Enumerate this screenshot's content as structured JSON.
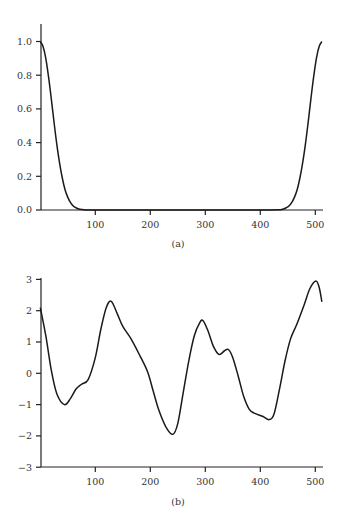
{
  "chart_data": [
    {
      "type": "line",
      "panel_label": "(a)",
      "title": "",
      "xlabel": "",
      "ylabel": "",
      "xlim": [
        0,
        512
      ],
      "ylim": [
        0.0,
        1.05
      ],
      "x_ticks": [
        "100",
        "200",
        "300",
        "400",
        "500"
      ],
      "y_ticks": [
        "0.0",
        "0.2",
        "0.4",
        "0.6",
        "0.8",
        "1.0"
      ],
      "grid": false,
      "legend": null,
      "series": [
        {
          "name": "window",
          "x": [
            0,
            5,
            10,
            15,
            20,
            25,
            30,
            35,
            40,
            45,
            50,
            55,
            60,
            65,
            70,
            80,
            100,
            200,
            300,
            400,
            432,
            442,
            447,
            452,
            457,
            462,
            467,
            472,
            477,
            482,
            487,
            492,
            497,
            502,
            507,
            512
          ],
          "values": [
            1.0,
            0.97,
            0.9,
            0.79,
            0.66,
            0.52,
            0.39,
            0.28,
            0.19,
            0.12,
            0.075,
            0.044,
            0.024,
            0.013,
            0.006,
            0.001,
            0.0,
            0.0,
            0.0,
            0.0,
            0.001,
            0.006,
            0.013,
            0.024,
            0.044,
            0.075,
            0.12,
            0.19,
            0.28,
            0.39,
            0.52,
            0.66,
            0.79,
            0.9,
            0.97,
            1.0
          ]
        }
      ]
    },
    {
      "type": "line",
      "panel_label": "(b)",
      "title": "",
      "xlabel": "",
      "ylabel": "",
      "xlim": [
        0,
        512
      ],
      "ylim": [
        -3,
        3
      ],
      "x_ticks": [
        "100",
        "200",
        "300",
        "400",
        "500"
      ],
      "y_ticks": [
        "-3",
        "-2",
        "-1",
        "0",
        "1",
        "2",
        "3"
      ],
      "grid": false,
      "legend": null,
      "series": [
        {
          "name": "signal",
          "x": [
            0,
            10,
            20,
            30,
            44,
            55,
            65,
            75,
            87,
            100,
            110,
            120,
            129,
            140,
            150,
            165,
            180,
            195,
            205,
            215,
            228,
            241,
            250,
            260,
            270,
            280,
            290,
            296,
            305,
            315,
            325,
            335,
            342,
            350,
            360,
            370,
            380,
            390,
            405,
            416,
            425,
            435,
            445,
            455,
            466,
            480,
            490,
            501,
            507,
            512
          ],
          "values": [
            2.1,
            1.2,
            0.1,
            -0.65,
            -1.0,
            -0.8,
            -0.5,
            -0.35,
            -0.2,
            0.5,
            1.4,
            2.1,
            2.3,
            1.9,
            1.5,
            1.1,
            0.6,
            0.05,
            -0.55,
            -1.15,
            -1.7,
            -1.95,
            -1.6,
            -0.6,
            0.4,
            1.2,
            1.62,
            1.68,
            1.35,
            0.85,
            0.6,
            0.72,
            0.76,
            0.5,
            -0.1,
            -0.75,
            -1.15,
            -1.28,
            -1.38,
            -1.48,
            -1.3,
            -0.5,
            0.4,
            1.1,
            1.55,
            2.2,
            2.7,
            2.95,
            2.75,
            2.28
          ]
        }
      ]
    }
  ]
}
